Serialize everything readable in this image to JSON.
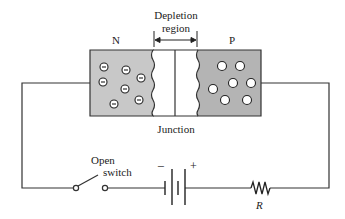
{
  "labels": {
    "n_region": "N",
    "p_region": "P",
    "depletion_line1": "Depletion",
    "depletion_line2": "region",
    "junction": "Junction",
    "switch_line1": "Open",
    "switch_line2": "switch",
    "battery_minus": "−",
    "battery_plus": "+",
    "resistor": "R"
  },
  "colors": {
    "n_fill": "#c8c8c8",
    "p_fill": "#b4b4b4",
    "depletion_fill": "#ffffff",
    "stroke": "#333333"
  },
  "carriers": {
    "n_electrons": 8,
    "p_holes": 8
  }
}
